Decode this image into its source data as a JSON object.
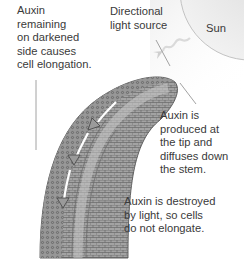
{
  "diagram": {
    "labels": {
      "left": "Auxin\nremaining\non darkened\nside causes\ncell elongation.",
      "light": "Directional\nlight source",
      "sun": "Sun",
      "tip": "Auxin is\nproduced at\nthe tip and\ndiffuses down\nthe stem.",
      "destroyed": "Auxin is destroyed\nby light, so cells\ndo not elongate."
    },
    "colors": {
      "stem_fill": "#9a9a9a",
      "stem_dark": "#6f6f6f",
      "sun_fill": "#e6e6e6",
      "text": "#3a3a3a",
      "leader": "#8a8a8a"
    }
  }
}
